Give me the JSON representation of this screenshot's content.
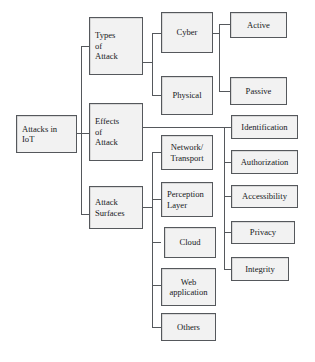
{
  "diagram": {
    "type": "tree",
    "orientation": "left-to-right",
    "style": {
      "node_fill": "#f2f2f2",
      "node_border": "#55585c",
      "text_color": "#17191c",
      "connector_color": "#55585c",
      "background": "#ffffff"
    },
    "root": {
      "id": "attacks-in-iot",
      "label": "Attacks in\nIoT"
    },
    "levels": [
      {
        "name": "categories",
        "nodes": [
          {
            "id": "types-of-attack",
            "label": "Types\nof\nAttack"
          },
          {
            "id": "effects-of-attack",
            "label": "Effects\nof\nAttack"
          },
          {
            "id": "attack-surfaces",
            "label": "Attack\nSurfaces"
          }
        ]
      },
      {
        "name": "subcategories",
        "nodes": [
          {
            "id": "cyber",
            "label": "Cyber",
            "parent": "types-of-attack"
          },
          {
            "id": "physical",
            "label": "Physical",
            "parent": "types-of-attack"
          },
          {
            "id": "network-transport",
            "label": "Network/\nTransport",
            "parent": "attack-surfaces"
          },
          {
            "id": "perception-layer",
            "label": "Perception\nLayer",
            "parent": "attack-surfaces"
          },
          {
            "id": "cloud",
            "label": "Cloud",
            "parent": "attack-surfaces"
          },
          {
            "id": "web-application",
            "label": "Web\napplication",
            "parent": "attack-surfaces"
          },
          {
            "id": "others",
            "label": "Others",
            "parent": "attack-surfaces"
          }
        ]
      },
      {
        "name": "leaves",
        "nodes": [
          {
            "id": "active",
            "label": "Active",
            "parent": "cyber"
          },
          {
            "id": "passive",
            "label": "Passive",
            "parent": "cyber"
          },
          {
            "id": "identification",
            "label": "Identification",
            "parent": "effects-of-attack"
          },
          {
            "id": "authorization",
            "label": "Authorization",
            "parent": "effects-of-attack"
          },
          {
            "id": "accessibility",
            "label": "Accessibility",
            "parent": "effects-of-attack"
          },
          {
            "id": "privacy",
            "label": "Privacy",
            "parent": "effects-of-attack"
          },
          {
            "id": "integrity",
            "label": "Integrity",
            "parent": "effects-of-attack"
          }
        ]
      }
    ]
  }
}
